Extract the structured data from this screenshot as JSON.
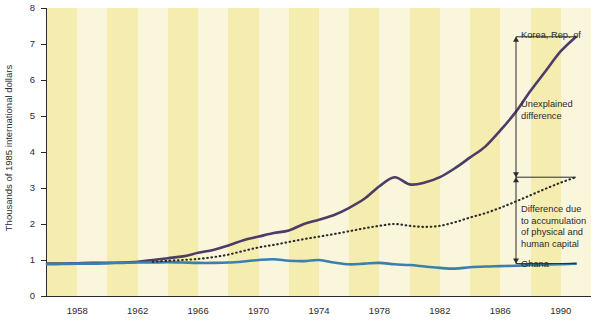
{
  "chart_data": {
    "type": "line",
    "title": "",
    "xlabel": "",
    "ylabel": "Thousands of 1985 international dollars",
    "xlim": [
      1956,
      1992
    ],
    "ylim": [
      0,
      8
    ],
    "yticks": [
      0,
      1,
      2,
      3,
      4,
      5,
      6,
      7,
      8
    ],
    "ytick_labels": [
      "0",
      "1",
      "2",
      "3",
      "4",
      "5",
      "6",
      "7",
      "8"
    ],
    "xticks": [
      1958,
      1962,
      1966,
      1970,
      1974,
      1978,
      1982,
      1986,
      1990
    ],
    "xtick_labels": [
      "1958",
      "1962",
      "1966",
      "1970",
      "1974",
      "1978",
      "1982",
      "1986",
      "1990"
    ],
    "grid": false,
    "legend_position": "right-annotations",
    "background": "alternating vertical pale-yellow and off-white bands, one band per 2 years",
    "series": [
      {
        "name": "Korea, Rep. of",
        "style": "solid",
        "color": "#4c3c66",
        "width": 2.6,
        "x": [
          1956,
          1957,
          1958,
          1959,
          1960,
          1961,
          1962,
          1963,
          1964,
          1965,
          1966,
          1967,
          1968,
          1969,
          1970,
          1971,
          1972,
          1973,
          1974,
          1975,
          1976,
          1977,
          1978,
          1979,
          1980,
          1981,
          1982,
          1983,
          1984,
          1985,
          1986,
          1987,
          1988,
          1989,
          1990,
          1991
        ],
        "y": [
          0.9,
          0.9,
          0.91,
          0.92,
          0.92,
          0.93,
          0.95,
          1.0,
          1.05,
          1.1,
          1.2,
          1.28,
          1.4,
          1.55,
          1.65,
          1.75,
          1.82,
          2.0,
          2.12,
          2.25,
          2.45,
          2.7,
          3.05,
          3.3,
          3.1,
          3.15,
          3.3,
          3.55,
          3.85,
          4.15,
          4.6,
          5.1,
          5.7,
          6.25,
          6.8,
          7.2
        ]
      },
      {
        "name": "Ghana",
        "style": "solid",
        "color": "#3a7fad",
        "width": 2.6,
        "x": [
          1956,
          1957,
          1958,
          1959,
          1960,
          1961,
          1962,
          1963,
          1964,
          1965,
          1966,
          1967,
          1968,
          1969,
          1970,
          1971,
          1972,
          1973,
          1974,
          1975,
          1976,
          1977,
          1978,
          1979,
          1980,
          1981,
          1982,
          1983,
          1984,
          1985,
          1986,
          1987,
          1988,
          1989,
          1990,
          1991
        ],
        "y": [
          0.88,
          0.89,
          0.9,
          0.9,
          0.91,
          0.92,
          0.93,
          0.93,
          0.94,
          0.93,
          0.92,
          0.92,
          0.93,
          0.96,
          1.0,
          1.02,
          0.98,
          0.97,
          1.0,
          0.93,
          0.88,
          0.9,
          0.92,
          0.88,
          0.86,
          0.82,
          0.78,
          0.76,
          0.8,
          0.82,
          0.83,
          0.84,
          0.86,
          0.87,
          0.88,
          0.9
        ]
      },
      {
        "name": "Difference due to accumulation of physical and human capital",
        "style": "dotted",
        "color": "#2b2b2b",
        "width": 1.8,
        "x": [
          1963,
          1964,
          1965,
          1966,
          1967,
          1968,
          1969,
          1970,
          1971,
          1972,
          1973,
          1974,
          1975,
          1976,
          1977,
          1978,
          1979,
          1980,
          1981,
          1982,
          1983,
          1984,
          1985,
          1986,
          1987,
          1988,
          1989,
          1990,
          1991
        ],
        "y": [
          0.95,
          0.98,
          1.0,
          1.03,
          1.08,
          1.15,
          1.25,
          1.35,
          1.42,
          1.5,
          1.58,
          1.65,
          1.72,
          1.8,
          1.88,
          1.95,
          2.0,
          1.95,
          1.92,
          1.95,
          2.05,
          2.18,
          2.3,
          2.45,
          2.62,
          2.8,
          2.98,
          3.15,
          3.3
        ]
      }
    ],
    "annotations": [
      {
        "id": "korea",
        "text": "Korea, Rep. of",
        "value": 7.2
      },
      {
        "id": "unexplained",
        "text": "Unexplained\ndifference",
        "arrow_from": 7.2,
        "arrow_to": 3.3
      },
      {
        "id": "capital",
        "text": "Difference due\nto accumulation\nof physical and\nhuman capital",
        "arrow_from": 3.3,
        "arrow_to": 0.9
      },
      {
        "id": "ghana",
        "text": "Ghana",
        "value": 0.9
      }
    ]
  },
  "colors": {
    "korea_line": "#4c3c66",
    "ghana_line": "#3a7fad",
    "dotted_line": "#2b2b2b",
    "band_light": "#faf6dc",
    "band_dark": "#f5ecb0",
    "axis": "#2b2b2b",
    "text": "#2b2b2b",
    "page_background": "#ffffff"
  },
  "axis": {
    "y_title": "Thousands of 1985 international dollars"
  },
  "annotations": {
    "korea_label": "Korea, Rep. of",
    "unexplained_label": "Unexplained\ndifference",
    "capital_label": "Difference due\nto accumulation\nof physical and\nhuman capital",
    "ghana_label": "Ghana"
  }
}
